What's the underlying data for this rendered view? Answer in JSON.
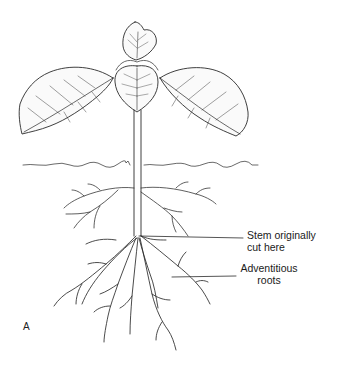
{
  "diagram": {
    "panel_label": "A",
    "labels": [
      {
        "id": "stem_cut",
        "line1": "Stem originally",
        "line2": "cut here"
      },
      {
        "id": "adventitious",
        "line1": "Adventitious",
        "line2": "roots"
      }
    ],
    "elements": {
      "leaves": [
        "top-leaf",
        "center-leaf",
        "left-leaf",
        "right-leaf"
      ],
      "stem": "stem",
      "soil_line": "soil-surface",
      "roots": [
        "upper-lateral-roots",
        "adventitious-roots"
      ]
    },
    "colors": {
      "line": "#2a2a2a",
      "background": "#ffffff"
    }
  }
}
